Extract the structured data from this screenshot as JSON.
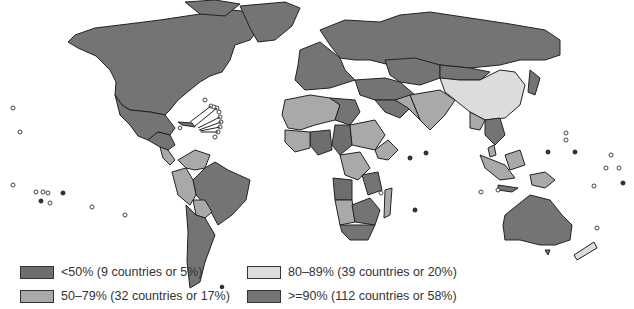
{
  "map": {
    "type": "choropleth world map",
    "palette": {
      "lt50": "#6e6e6e",
      "p50_79": "#a9a9a9",
      "p80_89": "#dcdcdc",
      "gte90": "#747474",
      "border": "#222222",
      "background": "#ffffff"
    }
  },
  "legend": {
    "items": [
      {
        "key": "lt50",
        "label": "<50% (9 countries or 5%)",
        "color": "#6e6e6e"
      },
      {
        "key": "p50_79",
        "label": "50–79% (32 countries or 17%)",
        "color": "#a9a9a9"
      },
      {
        "key": "p80_89",
        "label": "80–89% (39 countries or 20%)",
        "color": "#dcdcdc"
      },
      {
        "key": "gte90",
        "label": ">=90% (112 countries or 58%)",
        "color": "#747474"
      }
    ]
  }
}
